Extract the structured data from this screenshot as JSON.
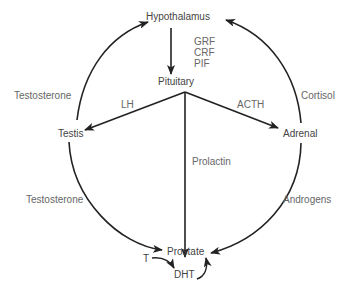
{
  "diagram": {
    "type": "endocrine-axis",
    "colors": {
      "line": "#222222",
      "text": "#555555",
      "background": "#ffffff"
    },
    "nodes": {
      "hypothalamus": "Hypothalamus",
      "pituitary": "Pituitary",
      "testis": "Testis",
      "adrenal": "Adrenal",
      "prostate": "Prostate",
      "t": "T",
      "dht": "DHT"
    },
    "edges": {
      "hypothalamus_to_pituitary": {
        "label_lines": [
          "GRF",
          "CRF",
          "PIF"
        ],
        "l0": "GRF",
        "l1": "CRF",
        "l2": "PIF"
      },
      "pituitary_to_testis": {
        "label": "LH"
      },
      "pituitary_to_adrenal": {
        "label": "ACTH"
      },
      "pituitary_to_prostate": {
        "label": "Prolactin"
      },
      "testis_to_hypothalamus": {
        "label": "Testosterone"
      },
      "adrenal_to_hypothalamus": {
        "label": "Cortisol"
      },
      "testis_to_prostate": {
        "label": "Testosterone"
      },
      "adrenal_to_prostate": {
        "label": "Androgens"
      },
      "t_to_dht": {
        "label": ""
      },
      "dht_to_prostate": {
        "label": ""
      }
    }
  }
}
